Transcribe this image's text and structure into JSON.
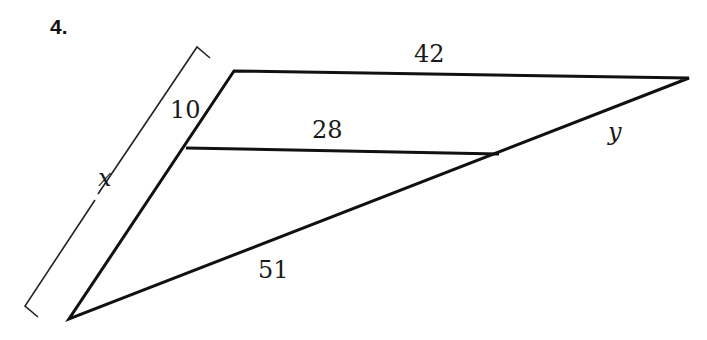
{
  "problem": {
    "number": "4."
  },
  "diagram": {
    "type": "triangle-with-parallel-segment",
    "vertices": {
      "top_left": [
        234,
        71
      ],
      "right": [
        689,
        78
      ],
      "bottom": [
        69,
        319
      ],
      "inner_left": [
        186,
        148
      ],
      "inner_right": [
        499,
        154
      ]
    },
    "labels": {
      "top_side": "42",
      "parallel_segment": "28",
      "left_upper_segment": "10",
      "left_side_total": "x",
      "right_upper_segment": "y",
      "lower_side": "51"
    },
    "stroke_color": "#111111"
  }
}
